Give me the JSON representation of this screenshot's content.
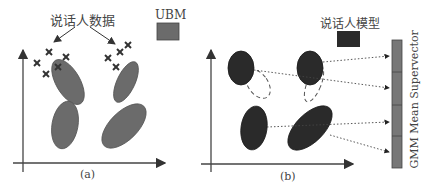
{
  "panel_a": {
    "caption": "(a)",
    "speaker_data_label": "说话人数据",
    "legend_label": "UBM",
    "legend_color": "#6b6b6b"
  },
  "panel_b": {
    "caption": "(b)",
    "speaker_model_label": "说话人模型",
    "legend_color": "#2a2a2a",
    "supervector_label": "GMM Mean Supervector",
    "supervector_color": "#777777"
  }
}
